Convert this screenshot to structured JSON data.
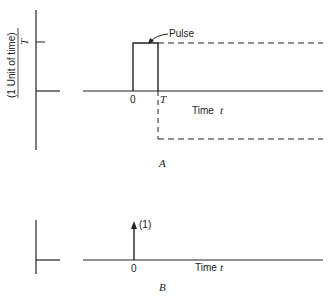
{
  "figure_a": {
    "panel_label": "A",
    "y_axis_label_numerator": "(1 Unit of time)",
    "y_axis_label_denominator": "T",
    "x_zero_label": "0",
    "x_T_label": "T",
    "x_axis_label": "Time",
    "x_axis_var": "t",
    "pulse_label": "Pulse"
  },
  "figure_b": {
    "panel_label": "B",
    "impulse_label": "(1)",
    "x_zero_label": "0",
    "x_axis_label": "Time",
    "x_axis_var": "t"
  },
  "colors": {
    "line": "#222222",
    "background": "#ffffff"
  }
}
